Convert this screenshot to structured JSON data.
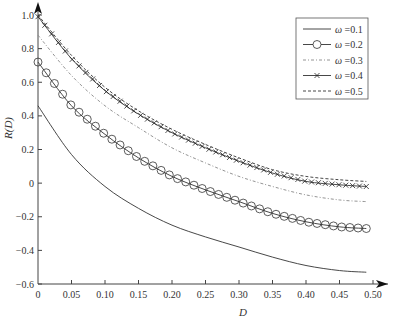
{
  "chart_data": {
    "type": "line",
    "title": "",
    "xlabel": "D",
    "ylabel": "R(D)",
    "xlim": [
      0,
      0.5
    ],
    "ylim": [
      -0.6,
      1.0
    ],
    "grid": false,
    "legend_position": "upper right",
    "xticks": [
      0,
      0.05,
      0.1,
      0.15,
      0.2,
      0.25,
      0.3,
      0.35,
      0.4,
      0.45,
      0.5
    ],
    "xtick_labels": [
      "0",
      "0.05",
      "0.10",
      "0.15",
      "0.20",
      "0.25",
      "0.30",
      "0.35",
      "0.40",
      "0.45",
      "0.50"
    ],
    "yticks": [
      -0.6,
      -0.4,
      -0.2,
      0,
      0.2,
      0.4,
      0.6,
      0.8,
      1.0
    ],
    "ytick_labels": [
      "-0.6",
      "-0.4",
      "-0.2",
      "0",
      "0.2",
      "0.4",
      "0.6",
      "0.8",
      "1.0"
    ],
    "x": [
      0,
      0.05,
      0.1,
      0.15,
      0.2,
      0.25,
      0.3,
      0.35,
      0.4,
      0.45,
      0.49
    ],
    "series": [
      {
        "name": "ω =0.1",
        "style": "solid",
        "marker": "none",
        "values": [
          0.46,
          0.17,
          -0.02,
          -0.15,
          -0.25,
          -0.32,
          -0.38,
          -0.44,
          -0.49,
          -0.52,
          -0.53
        ]
      },
      {
        "name": "ω =0.2",
        "style": "solid",
        "marker": "circle",
        "values": [
          0.72,
          0.46,
          0.29,
          0.15,
          0.04,
          -0.04,
          -0.11,
          -0.18,
          -0.23,
          -0.26,
          -0.27
        ]
      },
      {
        "name": "ω =0.3",
        "style": "dashdot",
        "marker": "none",
        "values": [
          0.88,
          0.64,
          0.46,
          0.33,
          0.21,
          0.12,
          0.04,
          -0.02,
          -0.07,
          -0.1,
          -0.11
        ]
      },
      {
        "name": "ω =0.4",
        "style": "solid",
        "marker": "cross",
        "values": [
          0.99,
          0.74,
          0.55,
          0.41,
          0.3,
          0.21,
          0.13,
          0.06,
          0.01,
          -0.01,
          -0.02
        ]
      },
      {
        "name": "ω =0.5",
        "style": "dashed",
        "marker": "none",
        "values": [
          1.0,
          0.76,
          0.57,
          0.43,
          0.32,
          0.23,
          0.15,
          0.08,
          0.04,
          0.02,
          0.01
        ]
      }
    ]
  },
  "legend": {
    "items": [
      "ω =0.1",
      "ω =0.2",
      "ω =0.3",
      "ω =0.4",
      "ω =0.5"
    ]
  }
}
